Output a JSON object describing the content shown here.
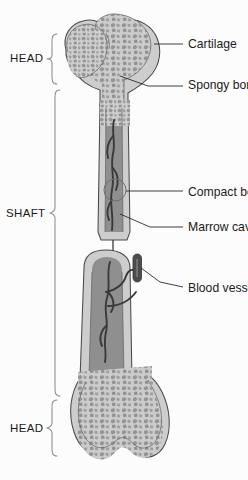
{
  "figure": {
    "background_color": "#fcfcfc",
    "outline_color": "#4a4a4a",
    "cortical_color": "#cdcdcd",
    "marrow_color": "#8f8f8f",
    "spongy_color": "#9a9a9a",
    "leader_color": "#2b2b2b",
    "bracket_color": "#8d8d8d",
    "vessel_color": "#4c4c4c"
  },
  "region_labels": [
    {
      "id": "head-top",
      "text": "HEAD",
      "x": 10,
      "y": 62,
      "bracket_top": 34,
      "bracket_bottom": 84,
      "bracket_x": 46
    },
    {
      "id": "shaft",
      "text": "SHAFT",
      "x": 6,
      "y": 217,
      "bracket_top": 90,
      "bracket_bottom": 396,
      "bracket_x": 52
    },
    {
      "id": "head-bottom",
      "text": "HEAD",
      "x": 10,
      "y": 432,
      "bracket_top": 400,
      "bracket_bottom": 456,
      "bracket_x": 46
    }
  ],
  "callouts": [
    {
      "id": "cartilage",
      "text": "Cartilage",
      "x": 188,
      "y": 48
    },
    {
      "id": "spongy-bone",
      "text": "Spongy bone",
      "x": 188,
      "y": 89
    },
    {
      "id": "compact-bone",
      "text": "Compact bone",
      "x": 188,
      "y": 196
    },
    {
      "id": "marrow-cavity",
      "text": "Marrow cavity",
      "x": 188,
      "y": 231
    },
    {
      "id": "blood-vessel",
      "text": "Blood vessel",
      "x": 188,
      "y": 292
    }
  ]
}
